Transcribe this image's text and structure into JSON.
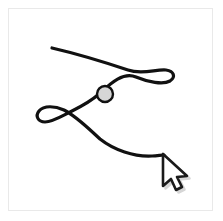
{
  "app": {
    "title": "Freeform Drawing Canvas",
    "background_color": "#ffffff"
  },
  "canvas": {
    "name": "drawing-canvas",
    "frame_color": "#e9e9e9",
    "fill_color": "#ffffff",
    "x": 8,
    "y": 8,
    "width": 205,
    "height": 203
  },
  "stroke": {
    "label": "freeform-ink-stroke",
    "color": "#111111",
    "width": 3.2,
    "style": "hand-drawn",
    "description": "Single continuous hand-drawn stroke with two small loops crossing in an X near the middle-left",
    "path": "M 52 48 C 78 54, 104 62, 128 70 C 142 75, 156 69, 166 70 C 174 71, 176 77, 170 81 C 163 85, 148 82, 136 77 C 122 71, 108 86, 99 94 C 90 102, 80 107, 72 111 C 62 116, 52 122, 45 122 C 38 122, 35 116, 39 111 C 44 105, 55 106, 64 110 C 76 116, 88 128, 100 139 C 114 150, 134 157, 152 156 C 157 156, 161 155, 164 155",
    "start_point": [
      52,
      48
    ],
    "end_point": [
      164,
      155
    ],
    "loops": [
      {
        "name": "right-loop",
        "center": [
          156,
          75
        ],
        "width": 24,
        "height": 13
      },
      {
        "name": "left-loop",
        "center": [
          52,
          114
        ],
        "width": 32,
        "height": 16
      }
    ],
    "crossing_point": [
      75,
      110
    ]
  },
  "node": {
    "label": "control-point-handle",
    "fill_color": "#d6d6d6",
    "stroke_color": "#111111",
    "stroke_width": 2.4,
    "center_x": 105,
    "center_y": 94,
    "radius": 8
  },
  "cursor": {
    "label": "mouse-pointer",
    "type": "arrow",
    "fill_color": "#ffffff",
    "stroke_color": "#1a1a1a",
    "shadow_color": "#b5b5b5",
    "tip_x": 163,
    "tip_y": 154,
    "path": "M 163 154 L 163 186 L 171 179 L 176 190 L 182 187 L 177 177 L 187 176 Z"
  }
}
